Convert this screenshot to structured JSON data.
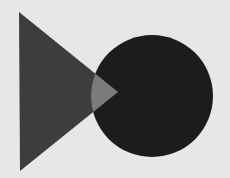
{
  "diagram": {
    "background": "#e7e7e7",
    "shapes": [
      {
        "kind": "triangle",
        "name": "right-pointing-triangle",
        "points": [
          [
            19,
            12
          ],
          [
            118,
            92
          ],
          [
            20,
            171
          ]
        ],
        "color": "#3d3d3d"
      },
      {
        "kind": "circle",
        "name": "dark-circle",
        "cx": 152,
        "cy": 96,
        "r": 61,
        "color": "#1c1c1c"
      },
      {
        "kind": "intersection",
        "name": "overlap-region",
        "color": "#7b7b7b"
      }
    ]
  }
}
